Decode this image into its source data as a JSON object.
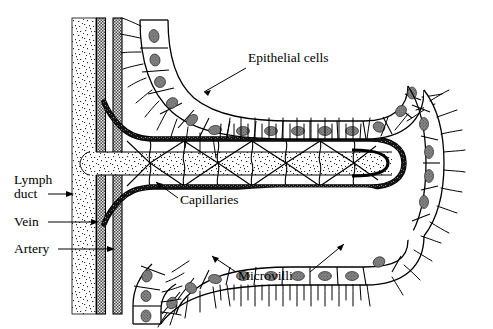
{
  "figure": {
    "background_color": "#ffffff",
    "line_color": "#000000",
    "nucleus_color": "#7d7d7d",
    "vessel_color": "#595959",
    "lacteal_fill": "#f2f2f2"
  },
  "labels": {
    "epithelial_cells": "Epithelial cells",
    "capillaries": "Capillaries",
    "microvilli": "Microvilli",
    "lymph_duct_line1": "Lymph",
    "lymph_duct_line2": "duct",
    "vein": "Vein",
    "artery": "Artery"
  },
  "structures": {
    "lymph_duct": "lymph-duct-vessel",
    "vein": "vein-vessel",
    "artery": "artery-vessel",
    "lacteal": "central-lacteal",
    "capillary_loop": "capillary-loop",
    "epithelium_upper": "upper-epithelial-layer",
    "epithelium_lower": "lower-epithelial-layer",
    "villus_tip": "villus-tip"
  }
}
